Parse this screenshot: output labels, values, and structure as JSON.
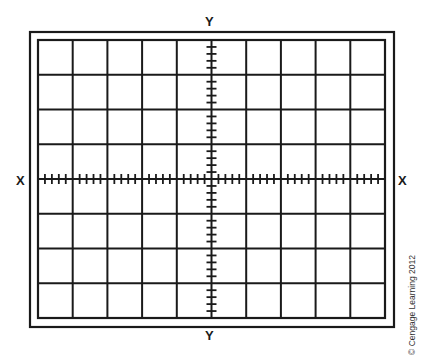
{
  "labels": {
    "y_top": "Y",
    "y_bottom": "Y",
    "x_left": "X",
    "x_right": "X"
  },
  "copyright": "© Cengage Learning 2012",
  "graticule": {
    "columns": 10,
    "rows": 8,
    "minor_ticks_per_division": 5,
    "outer_frame": {
      "x": 30,
      "y": 32,
      "w": 364,
      "h": 295
    },
    "inner_frame": {
      "x": 38,
      "y": 40,
      "w": 347,
      "h": 278
    },
    "line_color": "#1a1a1a",
    "background": "#ffffff"
  }
}
